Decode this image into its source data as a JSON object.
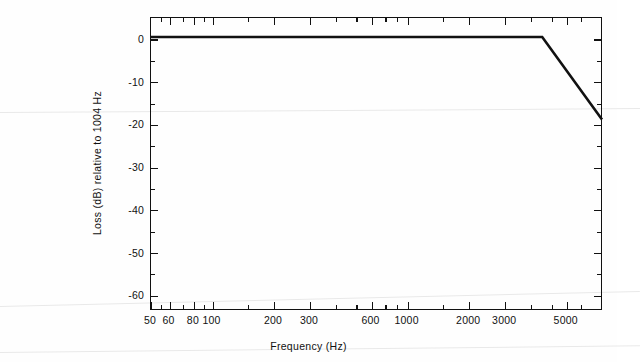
{
  "figure": {
    "background": "#fefefe",
    "line_color": "#111111",
    "axis_color": "#111111"
  },
  "chart_data": {
    "type": "line",
    "title": "",
    "xlabel": "Frequency (Hz)",
    "ylabel": "Loss (dB) relative to 1004 Hz",
    "xscale": "log",
    "yscale": "linear",
    "xlim": [
      50,
      5600
    ],
    "ylim": [
      -68.5,
      5.0
    ],
    "grid": false,
    "legend": null,
    "xticklabels": [
      "50",
      "60",
      "80",
      "100",
      "200",
      "300",
      "600",
      "1000",
      "2000",
      "3000",
      "5000"
    ],
    "xtickvalues": [
      50,
      60,
      80,
      100,
      200,
      300,
      600,
      1000,
      2000,
      3000,
      5000
    ],
    "yticklabels": [
      "0",
      "-10",
      "-20",
      "-30",
      "-40",
      "-50",
      "-60"
    ],
    "ytickvalues": [
      0,
      -10,
      -20,
      -30,
      -40,
      -50,
      -60
    ],
    "yminor_step": 5,
    "series": [
      {
        "name": "loss mask",
        "x": [
          50,
          100,
          200,
          300,
          600,
          1000,
          2000,
          3000,
          5600
        ],
        "y": [
          0,
          0,
          0,
          0,
          0,
          0,
          0,
          0,
          -20.7
        ]
      }
    ],
    "annotations": [
      "Flat at 0 dB from 50 Hz to 3000 Hz",
      "Linear roll-off from 3000 Hz to about -20.7 dB at 5600 Hz"
    ]
  }
}
